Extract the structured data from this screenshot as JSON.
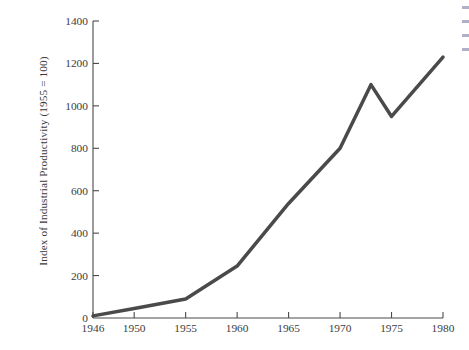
{
  "chart_data": {
    "type": "line",
    "title": "",
    "xlabel": "",
    "ylabel": "Index of Industrial Productivity (1955 = 100)",
    "xlim": [
      1946,
      1980
    ],
    "ylim": [
      0,
      1400
    ],
    "grid": false,
    "legend": null,
    "line_color": "#4a4a4a",
    "line_width": 3.5,
    "x_ticks": [
      1946,
      1950,
      1955,
      1960,
      1965,
      1970,
      1975,
      1980
    ],
    "x_tick_labels": [
      "1946",
      "1950",
      "1955",
      "1960",
      "1965",
      "1970",
      "1975",
      "1980"
    ],
    "y_ticks": [
      0,
      200,
      400,
      600,
      800,
      1000,
      1200,
      1400
    ],
    "y_tick_labels": [
      "0",
      "200",
      "400",
      "600",
      "800",
      "1000",
      "1200",
      "1400"
    ],
    "series": [
      {
        "name": "Index of Industrial Productivity",
        "x": [
          1946,
          1950,
          1955,
          1960,
          1965,
          1970,
          1973,
          1975,
          1980
        ],
        "values": [
          10,
          45,
          90,
          245,
          540,
          800,
          1100,
          950,
          1230
        ]
      }
    ]
  },
  "edge_marks": {
    "count": 4,
    "color": "#6f6f9a"
  }
}
